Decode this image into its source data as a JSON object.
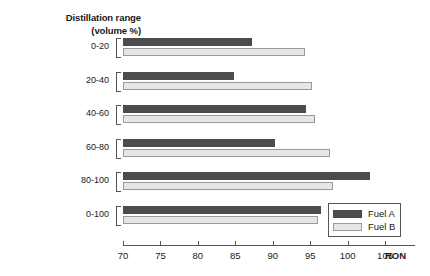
{
  "chart_data": {
    "type": "bar",
    "orientation": "horizontal",
    "title": "Distillation range",
    "subtitle": "(volume %)",
    "categories": [
      "0-20",
      "20-40",
      "40-60",
      "60-80",
      "80-100",
      "0-100"
    ],
    "series": [
      {
        "name": "Fuel A",
        "color": "#4c4c4c",
        "values": [
          87.2,
          84.8,
          94.5,
          90.3,
          103.0,
          96.5
        ]
      },
      {
        "name": "Fuel B",
        "color": "#e6e6e6",
        "values": [
          94.3,
          95.2,
          95.7,
          97.7,
          98.1,
          96.1
        ]
      }
    ],
    "xlabel": "RON",
    "ylabel": "Distillation range (volume %)",
    "xlim": [
      70,
      109
    ],
    "xticks": [
      70,
      75,
      80,
      85,
      90,
      95,
      100,
      105
    ],
    "xtick_labels": [
      "70",
      "75",
      "80",
      "85",
      "90",
      "95",
      "100",
      "105"
    ],
    "grid": false,
    "legend_position": "bottom-right",
    "legend_entries": [
      "Fuel A",
      "Fuel B"
    ]
  }
}
